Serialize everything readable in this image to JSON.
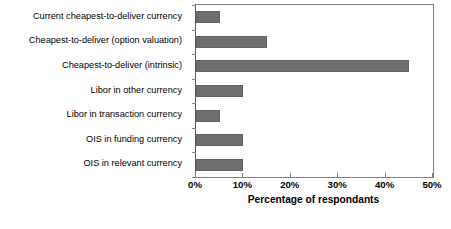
{
  "chart_data": {
    "type": "bar",
    "orientation": "horizontal",
    "title": "",
    "xlabel": "Percentage of respondants",
    "ylabel": "",
    "xlim": [
      0,
      50
    ],
    "xticks": [
      "0%",
      "10%",
      "20%",
      "30%",
      "40%",
      "50%"
    ],
    "xtick_values": [
      0,
      10,
      20,
      30,
      40,
      50
    ],
    "grid": false,
    "legend": null,
    "bar_color": "#6e6e6e",
    "axis_color": "#808080",
    "categories": [
      "Current cheapest-to-deliver currency",
      "Cheapest-to-deliver (option valuation)",
      "Cheapest-to-deliver (intrinsic)",
      "Libor in other currency",
      "Libor in transaction currency",
      "OIS in funding currency",
      "OIS in relevant currency"
    ],
    "values": [
      5,
      15,
      45,
      10,
      5,
      10,
      10
    ]
  }
}
